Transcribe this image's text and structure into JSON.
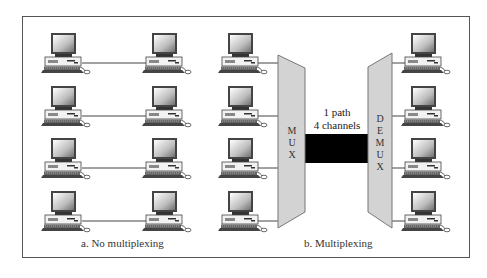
{
  "figure": {
    "left_panel": {
      "caption": "a. No multiplexing",
      "rows": 4,
      "links": [
        "row-1-link",
        "row-2-link",
        "row-3-link",
        "row-4-link"
      ]
    },
    "right_panel": {
      "caption": "b. Multiplexing",
      "mux_label": [
        "M",
        "U",
        "X"
      ],
      "demux_label": [
        "D",
        "E",
        "M",
        "U",
        "X"
      ],
      "path_label_line1": "1 path",
      "path_label_line2": "4 channels"
    },
    "colors": {
      "device_fill": "#d3d3d3",
      "device_stroke": "#777777",
      "link_bar": "#000000",
      "frame": "#555555"
    },
    "icons": {
      "computer": "desktop-computer-icon"
    }
  }
}
